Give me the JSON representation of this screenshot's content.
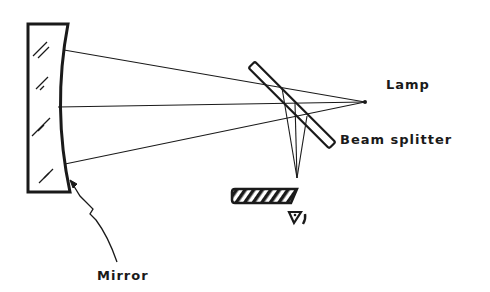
{
  "diagram": {
    "type": "optical-setup",
    "colors": {
      "ink": "#1a1a1a",
      "background": "#ffffff"
    },
    "labels": {
      "lamp": "Lamp",
      "beam_splitter": "Beam splitter",
      "mirror": "Mirror"
    },
    "components": [
      {
        "id": "mirror",
        "kind": "concave-mirror",
        "label": "Mirror"
      },
      {
        "id": "lamp",
        "kind": "point-source",
        "label": "Lamp"
      },
      {
        "id": "beam-splitter",
        "kind": "plate-beam-splitter",
        "label": "Beam splitter"
      },
      {
        "id": "knife-edge",
        "kind": "hatched-knife-edge",
        "label": ""
      },
      {
        "id": "eye",
        "kind": "observer-eye-symbol",
        "label": ""
      }
    ],
    "rays": [
      {
        "from": "mirror-top",
        "to": "lamp"
      },
      {
        "from": "mirror-center",
        "to": "lamp"
      },
      {
        "from": "mirror-bottom",
        "to": "lamp"
      },
      {
        "from": "beam-splitter",
        "to": "focus-near-knife-edge",
        "count": 3
      }
    ]
  }
}
